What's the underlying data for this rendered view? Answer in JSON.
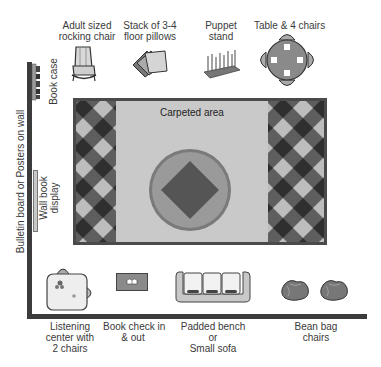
{
  "diagram": {
    "type": "classroom-reading-corner-floor-plan",
    "colors": {
      "wall": "#3c3c3c",
      "carpet_center": "#c9c9c9",
      "carpet_border": "#4a4a4a",
      "checker_dark": "#2f2f2f",
      "checker_mid": "#5e5e5e",
      "checker_light": "#bdbdbd",
      "circle_outer": "#7a7a7a",
      "circle_inner": "#9a9a9a",
      "diamond": "#555555"
    }
  },
  "walls": {
    "left_label": "Bulletin board or Posters on wall",
    "bookcase_label": "Book case",
    "wall_display_label_line1": "Wall book",
    "wall_display_label_line2": "display"
  },
  "carpet": {
    "label": "Carpeted area"
  },
  "top_items": [
    {
      "name": "rocking-chair",
      "line1": "Adult sized",
      "line2": "rocking chair",
      "icon": "rocking-chair-icon"
    },
    {
      "name": "floor-pillows",
      "line1": "Stack of 3-4",
      "line2": "floor pillows",
      "icon": "pillows-icon"
    },
    {
      "name": "puppet-stand",
      "line1": "Puppet",
      "line2": "stand",
      "icon": "puppet-stand-icon"
    },
    {
      "name": "table-chairs",
      "line1": "Table & 4 chairs",
      "line2": "",
      "icon": "table-chairs-icon"
    }
  ],
  "bottom_items": [
    {
      "name": "listening-center",
      "line1": "Listening",
      "line2": "center with",
      "line3": "2 chairs",
      "icon": "listening-center-icon"
    },
    {
      "name": "book-check",
      "line1": "Book check in",
      "line2": "& out",
      "line3": "",
      "icon": "book-check-icon"
    },
    {
      "name": "padded-bench",
      "line1": "Padded bench",
      "line2": "or",
      "line3": "Small sofa",
      "icon": "sofa-icon"
    },
    {
      "name": "bean-bags",
      "line1": "Bean bag",
      "line2": "chairs",
      "line3": "",
      "icon": "bean-bag-icon"
    }
  ]
}
